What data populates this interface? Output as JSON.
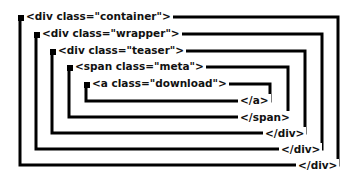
{
  "diagram": {
    "line_color": "#000000",
    "background": "#ffffff",
    "elements": [
      {
        "open": "<div class=\"container\">",
        "close": "</div>",
        "depth": 0
      },
      {
        "open": "<div class=\"wrapper\">",
        "close": "</div>",
        "depth": 1
      },
      {
        "open": "<div class=\"teaser\">",
        "close": "</div>",
        "depth": 2
      },
      {
        "open": "<span class=\"meta\">",
        "close": "</span>",
        "depth": 3
      },
      {
        "open": "<a class=\"download\">",
        "close": "</a>",
        "depth": 4
      }
    ]
  }
}
